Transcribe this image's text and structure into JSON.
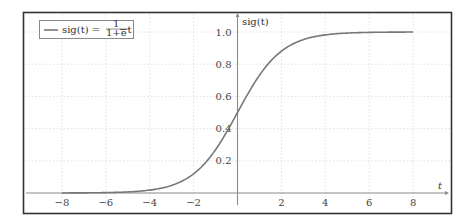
{
  "chart_data": {
    "type": "line",
    "title": "",
    "xlabel": "t",
    "ylabel": "sig(t)",
    "xlim": [
      -8.2,
      9.5
    ],
    "ylim": [
      0,
      1.05
    ],
    "x_ticks": [
      -8,
      -6,
      -4,
      -2,
      2,
      4,
      6,
      8
    ],
    "x_tick_labels": [
      "−8",
      "−6",
      "−4",
      "−2",
      "2",
      "4",
      "6",
      "8"
    ],
    "y_ticks": [
      0.2,
      0.4,
      0.6,
      0.8,
      1.0
    ],
    "y_tick_labels": [
      "0.2",
      "0.4",
      "0.6",
      "0.8",
      "1.0"
    ],
    "grid": true,
    "legend_position": "upper-left",
    "series": [
      {
        "name": "sig(t) = 1/(1+e^−t)",
        "function": "1/(1+exp(-t))",
        "color": "#777777",
        "x": [
          -8,
          -7,
          -6,
          -5,
          -4,
          -3,
          -2,
          -1,
          0,
          1,
          2,
          3,
          4,
          5,
          6,
          7,
          8
        ],
        "values": [
          0.0003,
          0.0009,
          0.0025,
          0.0067,
          0.018,
          0.047,
          0.119,
          0.269,
          0.5,
          0.731,
          0.881,
          0.953,
          0.982,
          0.993,
          0.9975,
          0.9991,
          0.9997
        ]
      }
    ]
  },
  "legend": {
    "label_main": "sig(t) =",
    "label_num": "1",
    "label_den": "1+e",
    "label_exp": "−t"
  },
  "axes": {
    "x_label": "t",
    "y_label": "sig(t)"
  },
  "colors": {
    "curve": "#777777",
    "axis": "#8a8a8a",
    "grid": "#d9d9d9",
    "frame": "#333333"
  }
}
